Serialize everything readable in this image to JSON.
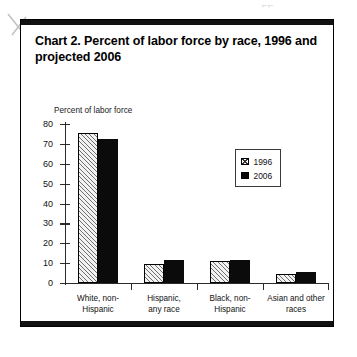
{
  "artifacts": {
    "top_mark": "⌐⌐",
    "scan_slash_name": "pencil-slash-artifact"
  },
  "chart_title": "Chart 2.  Percent of labor force by race, 1996 and projected 2006",
  "axis_title": "Percent of labor force",
  "legend": {
    "items": [
      {
        "label": "1996",
        "swatch": "hatched-square",
        "color": "#ffffff"
      },
      {
        "label": "2006",
        "swatch": "filled-square",
        "color": "#080808"
      }
    ]
  },
  "chart_data": {
    "type": "bar",
    "title": "Chart 2.  Percent of labor force by race, 1996 and projected 2006",
    "xlabel": "",
    "ylabel": "Percent of labor force",
    "ylim": [
      0,
      80
    ],
    "yticks": [
      0,
      10,
      20,
      30,
      40,
      50,
      60,
      70,
      80
    ],
    "ytick_labels": [
      "0",
      "10",
      "20",
      "30",
      "40",
      "50",
      "60",
      "70",
      "80"
    ],
    "grid": false,
    "legend_position": "upper-right-inset",
    "categories": [
      "White, non-Hispanic",
      "Hispanic, any race",
      "Black, non-Hispanic",
      "Asian and other races"
    ],
    "category_lines": [
      [
        "White, non-",
        "Hispanic"
      ],
      [
        "Hispanic,",
        "any race"
      ],
      [
        "Black, non-",
        "Hispanic"
      ],
      [
        "Asian and other",
        "races"
      ]
    ],
    "series": [
      {
        "name": "1996",
        "values": [
          75.3,
          9.5,
          11.3,
          4.3
        ]
      },
      {
        "name": "2006",
        "values": [
          72.5,
          11.7,
          11.6,
          5.4
        ]
      }
    ]
  }
}
